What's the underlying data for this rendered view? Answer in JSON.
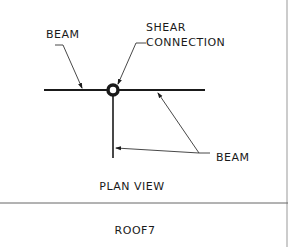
{
  "diagram": {
    "type": "structural-detail",
    "view_title": "PLAN VIEW",
    "footer_label": "ROOF7",
    "labels": {
      "beam_top_left": "BEAM",
      "shear_line1": "SHEAR",
      "shear_line2": "CONNECTION",
      "beam_right": "BEAM"
    },
    "colors": {
      "line": "#1a1a1a",
      "leader": "#333333",
      "divider": "#666666",
      "background": "#ffffff"
    },
    "nodes": [
      {
        "id": "shear-connection",
        "shape": "circle",
        "label": "SHEAR CONNECTION"
      },
      {
        "id": "beam-horizontal",
        "shape": "line",
        "label": "BEAM"
      },
      {
        "id": "beam-vertical",
        "shape": "line",
        "label": "BEAM"
      }
    ],
    "edges": [
      {
        "from": "label-beam-top-left",
        "to": "beam-horizontal",
        "type": "leader-arrow"
      },
      {
        "from": "label-shear-connection",
        "to": "shear-connection",
        "type": "leader-arrow"
      },
      {
        "from": "label-beam-right",
        "to": "beam-horizontal",
        "type": "leader-arrow"
      },
      {
        "from": "label-beam-right",
        "to": "beam-vertical",
        "type": "leader-arrow"
      }
    ]
  }
}
